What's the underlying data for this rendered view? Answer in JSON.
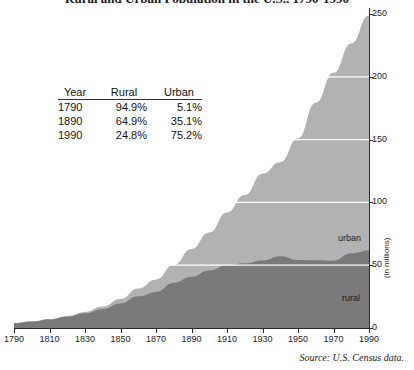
{
  "title": "Rural and Urban Population in the U.S., 1790-1990",
  "source_note": "Source: U.S. Census data.",
  "axis": {
    "y_label": "(in millions)",
    "y_ticks": [
      "0",
      "50",
      "100",
      "150",
      "200",
      "250"
    ],
    "x_ticks": [
      "1790",
      "1810",
      "1830",
      "1850",
      "1870",
      "1890",
      "1910",
      "1930",
      "1950",
      "1970",
      "1990"
    ]
  },
  "series_labels": {
    "urban": "urban",
    "rural": "rural"
  },
  "colors": {
    "urban": "#b2b2b2",
    "rural": "#7a7a7a",
    "gridline": "#ffffff",
    "axis": "#2b2b2b",
    "text": "#1c1c1c"
  },
  "inset_table": {
    "headers": [
      "Year",
      "Rural",
      "Urban"
    ],
    "rows": [
      {
        "year": "1790",
        "rural": "94.9%",
        "urban": "5.1%"
      },
      {
        "year": "1890",
        "rural": "64.9%",
        "urban": "35.1%"
      },
      {
        "year": "1990",
        "rural": "24.8%",
        "urban": "75.2%"
      }
    ]
  },
  "chart_data": {
    "type": "area",
    "stacked": true,
    "title": "Rural and Urban Population in the U.S., 1790-1990",
    "xlabel": "",
    "ylabel": "(in millions)",
    "xlim": [
      1790,
      1990
    ],
    "ylim": [
      0,
      250
    ],
    "grid": true,
    "legend": "in-plot labels",
    "x": [
      1790,
      1800,
      1810,
      1820,
      1830,
      1840,
      1850,
      1860,
      1870,
      1880,
      1890,
      1900,
      1910,
      1920,
      1930,
      1940,
      1950,
      1960,
      1970,
      1980,
      1990
    ],
    "series": [
      {
        "name": "rural",
        "color": "#7a7a7a",
        "values": [
          3.7,
          4.99,
          6.71,
          8.95,
          11.7,
          15.2,
          19.6,
          25.2,
          28.7,
          36.0,
          40.8,
          45.8,
          50.0,
          51.6,
          53.8,
          57.2,
          54.2,
          54.0,
          53.6,
          59.5,
          61.7
        ]
      },
      {
        "name": "urban",
        "color": "#b2b2b2",
        "values": [
          0.2,
          0.32,
          0.53,
          0.69,
          1.13,
          1.85,
          3.54,
          6.22,
          9.9,
          14.1,
          22.1,
          30.2,
          42.0,
          54.2,
          69.0,
          74.7,
          96.8,
          125.3,
          149.6,
          167.1,
          187.1
        ]
      }
    ],
    "totals": [
      3.9,
      5.3,
      7.2,
      9.6,
      12.9,
      17.1,
      23.2,
      31.4,
      38.6,
      50.2,
      62.9,
      76.0,
      92.0,
      105.7,
      122.8,
      131.7,
      151.3,
      179.3,
      203.2,
      226.5,
      248.7
    ],
    "annotations": [
      {
        "text": "urban",
        "x": 1985,
        "y": 100
      },
      {
        "text": "rural",
        "x": 1985,
        "y": 30
      }
    ]
  }
}
